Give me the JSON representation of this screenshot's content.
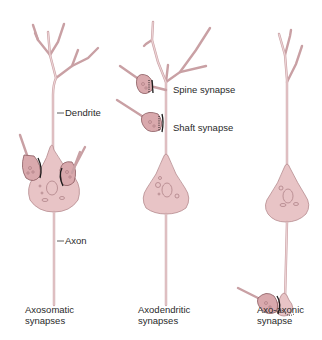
{
  "diagram": {
    "colors": {
      "neuron_fill": "#e8c4c6",
      "neuron_stroke": "#b58a8e",
      "terminal_fill": "#d9a9ad",
      "terminal_stroke": "#8a5a60",
      "label_text": "#2a2a2a"
    },
    "panels": [
      {
        "id": "axosomatic",
        "caption_line1": "Axosomatic",
        "caption_line2": "synapses",
        "labels": {
          "dendrite": "Dendrite",
          "axon": "Axon"
        }
      },
      {
        "id": "axodendritic",
        "caption_line1": "Axodendritic",
        "caption_line2": "synapses",
        "labels": {
          "spine": "Spine synapse",
          "shaft": "Shaft synapse"
        }
      },
      {
        "id": "axoaxonic",
        "caption_line1": "Axo-axonic",
        "caption_line2": "synapse"
      }
    ]
  }
}
